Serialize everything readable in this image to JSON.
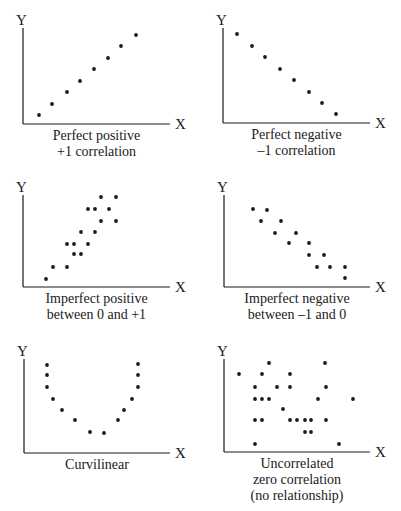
{
  "chart_data": [
    {
      "type": "scatter",
      "title": "Perfect positive +1 correlation",
      "caption_lines": [
        "Perfect positive",
        "+1 correlation"
      ],
      "xlabel": "X",
      "ylabel": "Y",
      "points": [
        [
          39,
          115
        ],
        [
          52,
          104
        ],
        [
          67,
          92
        ],
        [
          80,
          81
        ],
        [
          94,
          69
        ],
        [
          108,
          58
        ],
        [
          121,
          46
        ],
        [
          136,
          35
        ]
      ]
    },
    {
      "type": "scatter",
      "title": "Perfect negative -1 correlation",
      "caption_lines": [
        "Perfect negative",
        "–1 correlation"
      ],
      "xlabel": "X",
      "ylabel": "Y",
      "points": [
        [
          37,
          34
        ],
        [
          52,
          46
        ],
        [
          65,
          57
        ],
        [
          80,
          69
        ],
        [
          94,
          80
        ],
        [
          109,
          92
        ],
        [
          122,
          103
        ],
        [
          136,
          114
        ]
      ]
    },
    {
      "type": "scatter",
      "title": "Imperfect positive between 0 and +1",
      "caption_lines": [
        "Imperfect positive",
        "between 0 and +1"
      ],
      "xlabel": "X",
      "ylabel": "Y",
      "points": [
        [
          46,
          109
        ],
        [
          53,
          97
        ],
        [
          67,
          97
        ],
        [
          67,
          74
        ],
        [
          74,
          74
        ],
        [
          74,
          84
        ],
        [
          81,
          84
        ],
        [
          81,
          62
        ],
        [
          88,
          74
        ],
        [
          95,
          62
        ],
        [
          88,
          39
        ],
        [
          95,
          39
        ],
        [
          101,
          27
        ],
        [
          109,
          39
        ],
        [
          101,
          51
        ],
        [
          116,
          27
        ],
        [
          116,
          51
        ]
      ]
    },
    {
      "type": "scatter",
      "title": "Imperfect negative between -1 and 0",
      "caption_lines": [
        "Imperfect negative",
        "between –1 and 0"
      ],
      "xlabel": "X",
      "ylabel": "Y",
      "points": [
        [
          53,
          39
        ],
        [
          67,
          40
        ],
        [
          61,
          51
        ],
        [
          81,
          51
        ],
        [
          75,
          63
        ],
        [
          96,
          63
        ],
        [
          89,
          73
        ],
        [
          109,
          73
        ],
        [
          109,
          85
        ],
        [
          124,
          85
        ],
        [
          117,
          97
        ],
        [
          130,
          97
        ],
        [
          145,
          97
        ],
        [
          145,
          108
        ]
      ]
    },
    {
      "type": "scatter",
      "title": "Curvilinear",
      "caption_lines": [
        "Curvilinear"
      ],
      "xlabel": "X",
      "ylabel": "Y",
      "points": [
        [
          47,
          25
        ],
        [
          47,
          35
        ],
        [
          47,
          47
        ],
        [
          53,
          59
        ],
        [
          62,
          70
        ],
        [
          75,
          80
        ],
        [
          90,
          92
        ],
        [
          104,
          93
        ],
        [
          118,
          80
        ],
        [
          124,
          70
        ],
        [
          132,
          59
        ],
        [
          138,
          47
        ],
        [
          138,
          35
        ],
        [
          138,
          24
        ]
      ]
    },
    {
      "type": "scatter",
      "title": "Uncorrelated zero correlation (no relationship)",
      "caption_lines": [
        "Uncorrelated",
        "zero correlation",
        "(no relationship)"
      ],
      "xlabel": "X",
      "ylabel": "Y",
      "points": [
        [
          39,
          34
        ],
        [
          62,
          34
        ],
        [
          69,
          23
        ],
        [
          90,
          34
        ],
        [
          125,
          23
        ],
        [
          55,
          47
        ],
        [
          77,
          47
        ],
        [
          90,
          47
        ],
        [
          126,
          47
        ],
        [
          55,
          59
        ],
        [
          62,
          59
        ],
        [
          69,
          59
        ],
        [
          118,
          59
        ],
        [
          153,
          59
        ],
        [
          83,
          69
        ],
        [
          55,
          80
        ],
        [
          62,
          80
        ],
        [
          90,
          80
        ],
        [
          97,
          80
        ],
        [
          105,
          80
        ],
        [
          111,
          80
        ],
        [
          126,
          80
        ],
        [
          105,
          92
        ],
        [
          111,
          92
        ],
        [
          55,
          104
        ],
        [
          139,
          104
        ]
      ]
    }
  ],
  "axis": {
    "x_label": "X",
    "y_label": "Y"
  },
  "colors": {
    "ink": "#1a1a1a",
    "background": "#ffffff"
  }
}
